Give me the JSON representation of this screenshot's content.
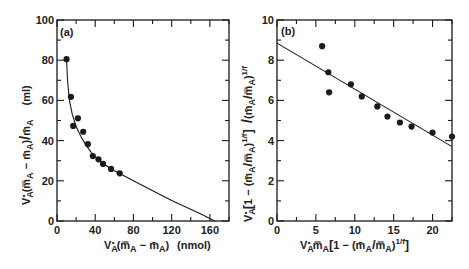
{
  "figure": {
    "panels": [
      "(a)",
      "(b)"
    ]
  },
  "chart_data": [
    {
      "type": "scatter",
      "panel_label": "(a)",
      "title": "",
      "xlabel": "V*A(m̿A − m̄A)  (nmol)",
      "ylabel": "V*A(m̿A − m̄A)/m̄A   (ml)",
      "xlim": [
        0,
        180
      ],
      "ylim": [
        0,
        100
      ],
      "x_ticks": [
        0,
        40,
        80,
        120,
        160
      ],
      "y_ticks": [
        0,
        20,
        40,
        60,
        80,
        100
      ],
      "x_tick_labels": [
        "0",
        "40",
        "80",
        "120",
        "160"
      ],
      "y_tick_labels": [
        "0",
        "20",
        "40",
        "60",
        "80",
        "100"
      ],
      "grid": false,
      "series": [
        {
          "name": "data",
          "kind": "points",
          "x": [
            10,
            14.6,
            17,
            21.9,
            27.4,
            32.3,
            37.5,
            43.4,
            48.2,
            56.6,
            65.6
          ],
          "y": [
            80.5,
            61.8,
            47.3,
            51.1,
            44.4,
            38.2,
            32.3,
            30.7,
            28.4,
            25.9,
            23.7
          ]
        },
        {
          "name": "fit",
          "kind": "curve",
          "x": [
            10,
            11,
            13,
            16,
            20,
            25,
            30,
            36,
            42,
            50,
            60,
            70,
            90,
            120,
            150,
            165
          ],
          "y": [
            80.5,
            70,
            60,
            53,
            47,
            42,
            38,
            34,
            31,
            28,
            25,
            22.5,
            17.5,
            10.2,
            3.6,
            0
          ]
        }
      ]
    },
    {
      "type": "scatter",
      "panel_label": "(b)",
      "title": "",
      "xlabel": "V*A m̿A [1 − (m̄A/m̿A)^(1/f)]",
      "ylabel": "V*A [1 − (m̄A/m̿A)^(1/f)] / (m̄A/m̿A)^(1/f)",
      "xlim": [
        0,
        22.5
      ],
      "ylim": [
        0,
        10
      ],
      "x_ticks": [
        0,
        5,
        10,
        15,
        20
      ],
      "y_ticks": [
        0,
        2,
        4,
        6,
        8,
        10
      ],
      "x_tick_labels": [
        "0",
        "5",
        "10",
        "15",
        "20"
      ],
      "y_tick_labels": [
        "0",
        "2",
        "4",
        "6",
        "8",
        "10"
      ],
      "grid": false,
      "series": [
        {
          "name": "data",
          "kind": "points",
          "x": [
            5.8,
            6.6,
            6.7,
            9.5,
            10.9,
            12.9,
            14.2,
            15.8,
            17.3,
            20.0,
            22.5
          ],
          "y": [
            8.7,
            7.4,
            6.4,
            6.8,
            6.2,
            5.7,
            5.2,
            4.9,
            4.7,
            4.4,
            4.2
          ]
        },
        {
          "name": "fit",
          "kind": "line",
          "x": [
            0,
            22.5
          ],
          "y": [
            8.85,
            3.7
          ]
        }
      ]
    }
  ],
  "labels": {
    "a": {
      "tag": "(a)",
      "xlabel_main": "V",
      "xlabel_sub": "A",
      "xlabel_rest": "(m̿",
      "xlabel_rest2": "A",
      "xlabel_rest3": " − m̄",
      "xlabel_rest4": "A",
      "xlabel_rest5": ")",
      "xlabel_unit": "(nmol)",
      "ylabel_text": "V*A(m̿A − m̄A)/m̄A",
      "ylabel_unit": "(ml)",
      "x_ticks": [
        "0",
        "40",
        "80",
        "120",
        "160"
      ],
      "y_ticks": [
        "0",
        "20",
        "40",
        "60",
        "80",
        "100"
      ]
    },
    "b": {
      "tag": "(b)",
      "xlabel_text": "V*A m̿A [1 − (m̄A/m̿A)1/f]",
      "ylabel_text": "V*A[1 − (m̄A/m̿A)1/f] /(m̄A/m̿A)1/f",
      "x_ticks": [
        "0",
        "5",
        "10",
        "15",
        "20"
      ],
      "y_ticks": [
        "0",
        "2",
        "4",
        "6",
        "8",
        "10"
      ]
    }
  },
  "colors": {
    "ink": "#1a1a1a",
    "background": "#ffffff"
  }
}
